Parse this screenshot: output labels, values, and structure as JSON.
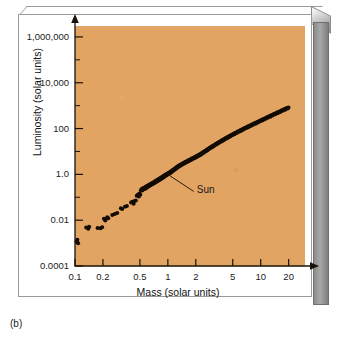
{
  "figure": {
    "caption": "(b)",
    "panel_background": "#e2a462",
    "point_color": "#120c05"
  },
  "annotation": {
    "sun_label": "Sun"
  },
  "chart_data": {
    "type": "scatter",
    "title": "",
    "xlabel": "Mass (solar units)",
    "ylabel": "Luminosity (solar units)",
    "xscale": "log",
    "yscale": "log",
    "xlim": [
      0.1,
      30
    ],
    "ylim": [
      0.0001,
      3000000
    ],
    "grid": false,
    "legend": null,
    "xticks": [
      0.1,
      0.2,
      0.5,
      1,
      2,
      5,
      10,
      20
    ],
    "xtick_labels": [
      "0.1",
      "0.2",
      "0.5",
      "1",
      "2",
      "5",
      "10",
      "20"
    ],
    "yticks": [
      0.0001,
      0.01,
      1.0,
      100,
      10000,
      1000000
    ],
    "ytick_labels": [
      "0.0001",
      "0.01",
      "1.0",
      "100",
      "10,000",
      "1,000,000"
    ],
    "annotations": [
      {
        "text": "Sun",
        "x": 1.0,
        "y": 1.0,
        "label_x": 1.9,
        "label_y": 0.18
      }
    ],
    "series": [
      {
        "name": "Main-sequence stars",
        "points": [
          [
            0.104,
            0.00115
          ],
          [
            0.106,
            0.0014
          ],
          [
            0.108,
            0.00098
          ],
          [
            0.132,
            0.0048
          ],
          [
            0.139,
            0.0042
          ],
          [
            0.142,
            0.0052
          ],
          [
            0.175,
            0.0046
          ],
          [
            0.188,
            0.0045
          ],
          [
            0.196,
            0.0049
          ],
          [
            0.205,
            0.0115
          ],
          [
            0.212,
            0.0098
          ],
          [
            0.222,
            0.0135
          ],
          [
            0.228,
            0.0122
          ],
          [
            0.252,
            0.0168
          ],
          [
            0.268,
            0.0185
          ],
          [
            0.285,
            0.0205
          ],
          [
            0.312,
            0.0335
          ],
          [
            0.322,
            0.031
          ],
          [
            0.345,
            0.0385
          ],
          [
            0.362,
            0.042
          ],
          [
            0.402,
            0.0585
          ],
          [
            0.415,
            0.064
          ],
          [
            0.428,
            0.0525
          ],
          [
            0.438,
            0.0685
          ],
          [
            0.452,
            0.072
          ],
          [
            0.462,
            0.118
          ],
          [
            0.478,
            0.132
          ],
          [
            0.488,
            0.108
          ],
          [
            0.496,
            0.148
          ],
          [
            0.505,
            0.128
          ],
          [
            0.512,
            0.205
          ],
          [
            0.522,
            0.232
          ],
          [
            0.531,
            0.196
          ],
          [
            0.542,
            0.252
          ],
          [
            0.552,
            0.222
          ],
          [
            0.562,
            0.268
          ],
          [
            0.572,
            0.238
          ],
          [
            0.582,
            0.292
          ],
          [
            0.592,
            0.262
          ],
          [
            0.602,
            0.318
          ],
          [
            0.612,
            0.285
          ],
          [
            0.622,
            0.345
          ],
          [
            0.632,
            0.312
          ],
          [
            0.642,
            0.372
          ],
          [
            0.652,
            0.332
          ],
          [
            0.662,
            0.398
          ],
          [
            0.672,
            0.358
          ],
          [
            0.682,
            0.425
          ],
          [
            0.692,
            0.385
          ],
          [
            0.702,
            0.455
          ],
          [
            0.712,
            0.412
          ],
          [
            0.722,
            0.488
          ],
          [
            0.732,
            0.442
          ],
          [
            0.742,
            0.522
          ],
          [
            0.752,
            0.472
          ],
          [
            0.762,
            0.558
          ],
          [
            0.772,
            0.505
          ],
          [
            0.782,
            0.595
          ],
          [
            0.792,
            0.538
          ],
          [
            0.802,
            0.632
          ],
          [
            0.812,
            0.572
          ],
          [
            0.822,
            0.675
          ],
          [
            0.832,
            0.612
          ],
          [
            0.842,
            0.718
          ],
          [
            0.852,
            0.652
          ],
          [
            0.862,
            0.762
          ],
          [
            0.872,
            0.695
          ],
          [
            0.882,
            0.808
          ],
          [
            0.892,
            0.738
          ],
          [
            0.902,
            0.855
          ],
          [
            0.912,
            0.785
          ],
          [
            0.922,
            0.905
          ],
          [
            0.932,
            0.832
          ],
          [
            0.942,
            0.958
          ],
          [
            0.952,
            0.882
          ],
          [
            0.962,
            1.012
          ],
          [
            0.972,
            0.935
          ],
          [
            0.982,
            1.068
          ],
          [
            0.992,
            0.988
          ],
          [
            1.0,
            1.0
          ],
          [
            1.008,
            1.125
          ],
          [
            1.018,
            1.042
          ],
          [
            1.028,
            1.185
          ],
          [
            1.038,
            1.098
          ],
          [
            1.048,
            1.248
          ],
          [
            1.058,
            1.158
          ],
          [
            1.068,
            1.312
          ],
          [
            1.078,
            1.218
          ],
          [
            1.088,
            1.378
          ],
          [
            1.098,
            1.282
          ],
          [
            1.112,
            1.485
          ],
          [
            1.125,
            1.392
          ],
          [
            1.138,
            1.585
          ],
          [
            1.152,
            1.488
          ],
          [
            1.165,
            1.692
          ],
          [
            1.178,
            1.592
          ],
          [
            1.192,
            1.805
          ],
          [
            1.205,
            1.702
          ],
          [
            1.218,
            1.925
          ],
          [
            1.232,
            1.818
          ],
          [
            1.245,
            2.052
          ],
          [
            1.258,
            1.938
          ],
          [
            1.272,
            2.185
          ],
          [
            1.285,
            2.065
          ],
          [
            1.298,
            2.325
          ],
          [
            1.315,
            2.198
          ],
          [
            1.332,
            2.472
          ],
          [
            1.348,
            2.338
          ],
          [
            1.365,
            2.628
          ],
          [
            1.382,
            2.485
          ],
          [
            1.398,
            2.792
          ],
          [
            1.418,
            2.638
          ],
          [
            1.438,
            2.965
          ],
          [
            1.458,
            2.802
          ],
          [
            1.478,
            3.148
          ],
          [
            1.498,
            2.975
          ],
          [
            1.518,
            3.342
          ],
          [
            1.538,
            3.158
          ],
          [
            1.558,
            3.545
          ],
          [
            1.578,
            3.352
          ],
          [
            1.602,
            3.762
          ],
          [
            1.625,
            3.558
          ],
          [
            1.648,
            3.992
          ],
          [
            1.672,
            3.775
          ],
          [
            1.695,
            4.232
          ],
          [
            1.718,
            4.005
          ],
          [
            1.742,
            4.485
          ],
          [
            1.765,
            4.245
          ],
          [
            1.788,
            4.752
          ],
          [
            1.812,
            4.498
          ],
          [
            1.838,
            5.032
          ],
          [
            1.862,
            4.765
          ],
          [
            1.888,
            5.332
          ],
          [
            1.912,
            5.045
          ],
          [
            1.938,
            5.645
          ],
          [
            1.965,
            5.342
          ],
          [
            1.992,
            5.975
          ],
          [
            2.018,
            5.655
          ],
          [
            2.045,
            6.325
          ],
          [
            2.072,
            5.985
          ],
          [
            2.098,
            6.692
          ],
          [
            2.125,
            6.335
          ],
          [
            2.152,
            7.082
          ],
          [
            2.182,
            6.705
          ],
          [
            2.212,
            7.492
          ],
          [
            2.242,
            7.095
          ],
          [
            2.272,
            7.925
          ],
          [
            2.305,
            8.382
          ],
          [
            2.338,
            7.935
          ],
          [
            2.372,
            8.865
          ],
          [
            2.405,
            9.385
          ],
          [
            2.438,
            8.885
          ],
          [
            2.472,
            9.925
          ],
          [
            2.508,
            10.52
          ],
          [
            2.545,
            9.945
          ],
          [
            2.582,
            11.12
          ],
          [
            2.618,
            11.78
          ],
          [
            2.655,
            11.15
          ],
          [
            2.692,
            12.48
          ],
          [
            2.732,
            13.22
          ],
          [
            2.772,
            12.52
          ],
          [
            2.812,
            14.02
          ],
          [
            2.855,
            14.85
          ],
          [
            2.898,
            14.05
          ],
          [
            2.942,
            15.75
          ],
          [
            2.988,
            16.68
          ],
          [
            3.032,
            15.78
          ],
          [
            3.078,
            17.68
          ],
          [
            3.125,
            18.75
          ],
          [
            3.172,
            17.72
          ],
          [
            3.222,
            19.88
          ],
          [
            3.272,
            21.05
          ],
          [
            3.322,
            19.92
          ],
          [
            3.375,
            22.32
          ],
          [
            3.428,
            23.68
          ],
          [
            3.482,
            22.38
          ],
          [
            3.538,
            25.08
          ],
          [
            3.595,
            26.62
          ],
          [
            3.652,
            25.15
          ],
          [
            3.712,
            28.18
          ],
          [
            3.772,
            29.88
          ],
          [
            3.835,
            28.25
          ],
          [
            3.898,
            31.68
          ],
          [
            3.962,
            33.58
          ],
          [
            4.028,
            31.75
          ],
          [
            4.095,
            35.62
          ],
          [
            4.165,
            37.78
          ],
          [
            4.235,
            35.72
          ],
          [
            4.308,
            40.05
          ],
          [
            4.382,
            42.45
          ],
          [
            4.458,
            40.15
          ],
          [
            4.535,
            45.05
          ],
          [
            4.615,
            47.78
          ],
          [
            4.698,
            45.15
          ],
          [
            4.782,
            50.62
          ],
          [
            4.868,
            53.68
          ],
          [
            4.955,
            50.75
          ],
          [
            5.045,
            56.92
          ],
          [
            5.138,
            60.35
          ],
          [
            5.232,
            57.05
          ],
          [
            5.328,
            64.05
          ],
          [
            5.428,
            67.88
          ],
          [
            5.528,
            64.15
          ],
          [
            5.632,
            71.92
          ],
          [
            5.738,
            76.28
          ],
          [
            5.848,
            72.05
          ],
          [
            5.958,
            80.85
          ],
          [
            6.072,
            85.72
          ],
          [
            6.188,
            81.02
          ],
          [
            6.308,
            90.85
          ],
          [
            6.428,
            96.35
          ],
          [
            6.552,
            91.08
          ],
          [
            6.682,
            102.2
          ],
          [
            6.812,
            108.2
          ],
          [
            6.945,
            102.3
          ],
          [
            7.082,
            114.8
          ],
          [
            7.222,
            121.8
          ],
          [
            7.365,
            115.2
          ],
          [
            7.512,
            129.2
          ],
          [
            7.662,
            137.0
          ],
          [
            7.815,
            129.5
          ],
          [
            7.972,
            145.2
          ],
          [
            8.132,
            154.0
          ],
          [
            8.298,
            145.6
          ],
          [
            8.465,
            163.2
          ],
          [
            8.638,
            173.2
          ],
          [
            8.812,
            163.8
          ],
          [
            8.992,
            183.5
          ],
          [
            9.175,
            194.8
          ],
          [
            9.362,
            184.2
          ],
          [
            9.552,
            206.5
          ],
          [
            9.748,
            219.0
          ],
          [
            9.948,
            207.2
          ],
          [
            10.15,
            232.2
          ],
          [
            10.36,
            246.2
          ],
          [
            10.57,
            233.0
          ],
          [
            10.78,
            261.2
          ],
          [
            11.0,
            277.0
          ],
          [
            11.22,
            262.0
          ],
          [
            11.45,
            293.5
          ],
          [
            11.69,
            311.5
          ],
          [
            11.93,
            294.5
          ],
          [
            12.17,
            330.2
          ],
          [
            12.42,
            350.0
          ],
          [
            12.68,
            331.2
          ],
          [
            12.94,
            371.0
          ],
          [
            13.21,
            393.5
          ],
          [
            13.48,
            372.0
          ],
          [
            13.76,
            417.0
          ],
          [
            14.05,
            442.0
          ],
          [
            14.34,
            418.2
          ],
          [
            14.64,
            468.5
          ],
          [
            14.94,
            497.0
          ],
          [
            15.25,
            470.0
          ],
          [
            15.57,
            527.0
          ],
          [
            15.89,
            558.5
          ],
          [
            16.22,
            528.5
          ],
          [
            16.56,
            592.0
          ],
          [
            16.9,
            628.0
          ],
          [
            17.25,
            594.0
          ],
          [
            17.61,
            665.5
          ],
          [
            17.98,
            705.5
          ],
          [
            18.36,
            667.5
          ],
          [
            18.74,
            748.0
          ],
          [
            19.13,
            793.0
          ],
          [
            19.53,
            750.0
          ],
          [
            19.94,
            840.5
          ]
        ]
      }
    ]
  }
}
